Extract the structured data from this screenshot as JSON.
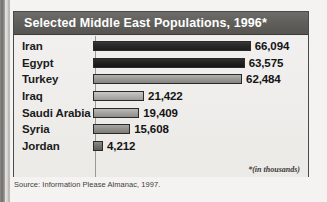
{
  "chart_data": {
    "type": "bar",
    "orientation": "horizontal",
    "title": "Selected Middle East Populations, 1996*",
    "categories": [
      "Iran",
      "Egypt",
      "Turkey",
      "Iraq",
      "Saudi Arabia",
      "Syria",
      "Jordan"
    ],
    "values": [
      66094,
      63575,
      62484,
      21422,
      19409,
      15608,
      4212
    ],
    "value_labels": [
      "66,094",
      "63,575",
      "62,484",
      "21,422",
      "19,409",
      "15,608",
      "4,212"
    ],
    "xlabel": "",
    "ylabel": "",
    "xlim": [
      0,
      70000
    ],
    "grid": false,
    "legend": false,
    "footnote": "*(in thousands)",
    "source": "Source: Information Please Almanac, 1997.",
    "bar_shades": [
      "shade-dark",
      "shade-darker",
      "shade-mid",
      "shade-light",
      "shade-medgray",
      "shade-gray",
      "shade-dkgray"
    ],
    "colors": {
      "title_band": "#5f5d5a",
      "title_text": "#ffffff",
      "panel_bg": "#eeedea",
      "panel_border": "#4b4a48",
      "bar_outline": "#2a2a2a",
      "text": "#1b1b1b"
    }
  }
}
